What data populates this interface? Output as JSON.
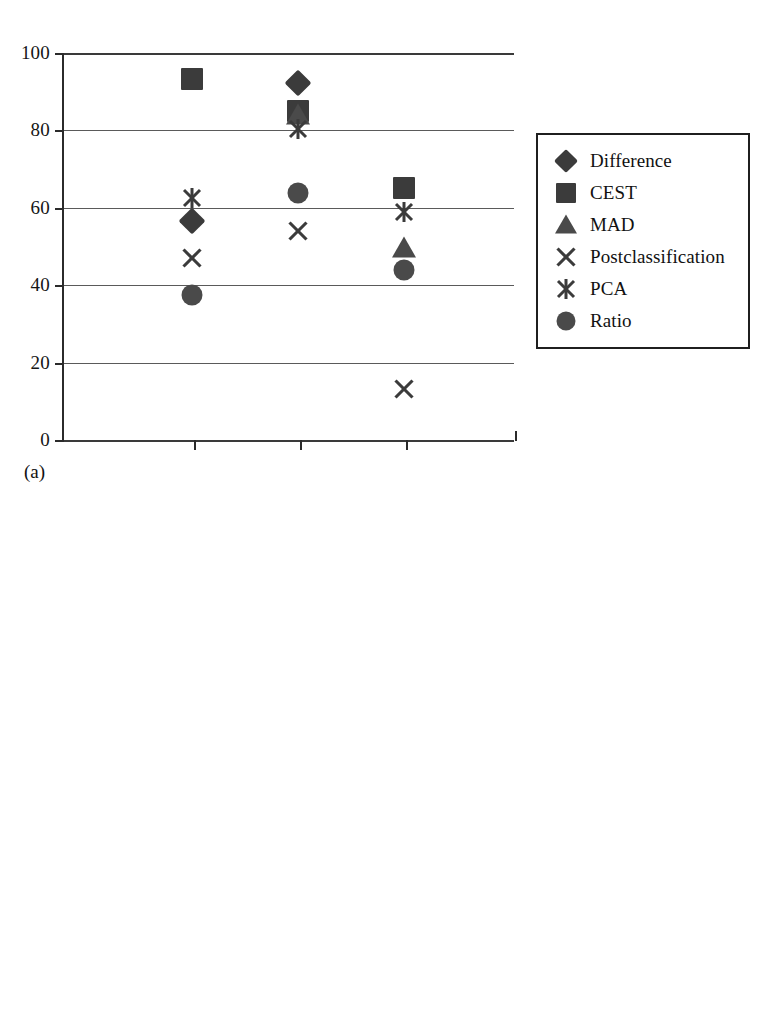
{
  "figure": {
    "panels": [
      {
        "id": "a",
        "caption": "(a)",
        "legend_position": "right"
      },
      {
        "id": "b",
        "caption": "(b)",
        "legend_position": "right"
      }
    ]
  },
  "legend": {
    "entries": [
      {
        "label": "Difference",
        "marker": "diamond"
      },
      {
        "label": "CEST",
        "marker": "square"
      },
      {
        "label": "MAD",
        "marker": "triangle"
      },
      {
        "label": "Postclassification",
        "marker": "cross"
      },
      {
        "label": "PCA",
        "marker": "star"
      },
      {
        "label": "Ratio",
        "marker": "circle"
      }
    ]
  },
  "axis": {
    "y_ticks": [
      "100",
      "80",
      "60",
      "40",
      "20",
      "0"
    ],
    "y_tick_values": [
      100,
      80,
      60,
      40,
      20,
      0
    ],
    "x_tick_labels": [
      "",
      "",
      ""
    ]
  },
  "chart_data": [
    {
      "type": "scatter",
      "title": "(a)",
      "xlabel": "",
      "ylabel": "",
      "ylim": [
        0,
        100
      ],
      "grid": true,
      "legend_position": "right",
      "categories": [
        "1",
        "2",
        "3"
      ],
      "x": [
        1,
        2,
        3
      ],
      "series": [
        {
          "name": "Difference",
          "marker": "diamond",
          "values": [
            56.5,
            92.3,
            null
          ]
        },
        {
          "name": "CEST",
          "marker": "square",
          "values": [
            93.3,
            85.0,
            65.0
          ]
        },
        {
          "name": "MAD",
          "marker": "triangle",
          "values": [
            null,
            84.0,
            49.5
          ]
        },
        {
          "name": "Postclassification",
          "marker": "cross",
          "values": [
            47.0,
            54.0,
            13.3
          ]
        },
        {
          "name": "PCA",
          "marker": "star",
          "values": [
            62.5,
            80.3,
            59.0
          ]
        },
        {
          "name": "Ratio",
          "marker": "circle",
          "values": [
            37.5,
            63.8,
            44.0
          ]
        }
      ]
    },
    {
      "type": "scatter",
      "title": "(b)",
      "xlabel": "",
      "ylabel": "",
      "ylim": [
        0,
        100
      ],
      "grid": true,
      "legend_position": "right",
      "categories": [
        "1",
        "2",
        "3"
      ],
      "x": [
        1,
        2,
        3
      ],
      "series": [
        {
          "name": "Difference",
          "marker": "diamond",
          "values": [
            37.5,
            71.3,
            77.0
          ]
        },
        {
          "name": "CEST",
          "marker": "square",
          "values": [
            63.3,
            80.8,
            96.5
          ]
        },
        {
          "name": "MAD",
          "marker": "triangle",
          "values": [
            45.5,
            78.0,
            72.0
          ]
        },
        {
          "name": "Postclassification",
          "marker": "cross",
          "values": [
            91.8,
            15.2,
            13.2
          ]
        },
        {
          "name": "PCA",
          "marker": "star",
          "values": [
            56.0,
            92.5,
            70.0
          ]
        },
        {
          "name": "Ratio",
          "marker": "circle",
          "values": [
            8.0,
            92.0,
            63.5
          ]
        }
      ]
    }
  ],
  "geometry": {
    "plot_left": 62,
    "plot_width": 452,
    "panel_a": {
      "plot_top": 53,
      "plot_height": 387,
      "legend_left": 536,
      "legend_top": 133,
      "caption_left": 24,
      "caption_top": 462
    },
    "panel_b": {
      "plot_top": 554,
      "plot_height": 376,
      "legend_left": 530,
      "legend_top": 620,
      "caption_left": 24,
      "caption_top": 952
    }
  }
}
